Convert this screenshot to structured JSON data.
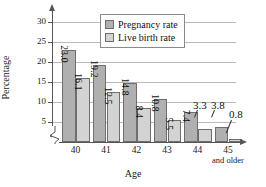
{
  "chart_data": {
    "type": "bar",
    "title": "",
    "xlabel": "Age",
    "ylabel": "Percentage",
    "categories": [
      "40",
      "41",
      "42",
      "43",
      "44",
      "45"
    ],
    "category_sublabels": [
      "",
      "",
      "",
      "",
      "",
      "and older"
    ],
    "series": [
      {
        "name": "Pregnancy rate",
        "color": "#b0b0b0",
        "values": [
          23.0,
          19.2,
          14.8,
          10.8,
          7.4,
          3.8
        ],
        "labels": [
          "23.0",
          "19.2",
          "14.8",
          "10.8",
          "7.4",
          "3.8"
        ]
      },
      {
        "name": "Live birth rate",
        "color": "#d3d3d3",
        "values": [
          16.1,
          12.5,
          8.4,
          5.5,
          3.3,
          0.8
        ],
        "labels": [
          "16.1",
          "12.5",
          "8.4",
          "5.5",
          "3.3",
          "0.8"
        ]
      }
    ],
    "ylim": [
      0,
      32
    ],
    "yticks": [
      5,
      10,
      15,
      20,
      25,
      30
    ],
    "ytick_labels": [
      "5",
      "10",
      "15",
      "20",
      "25",
      "30"
    ],
    "grid": true,
    "axis_break": true,
    "legend_position": "top-center"
  },
  "legend": {
    "items": [
      {
        "label": "Pregnancy rate",
        "color": "#b0b0b0"
      },
      {
        "label": "Live birth rate",
        "color": "#d3d3d3"
      }
    ]
  },
  "axes": {
    "y_title": "Percentage",
    "x_title": "Age",
    "y_ticks": [
      "5",
      "10",
      "15",
      "20",
      "25",
      "30"
    ],
    "x_ticks": [
      "40",
      "41",
      "42",
      "43",
      "44",
      "45"
    ],
    "x_tick_extra": "and older"
  }
}
